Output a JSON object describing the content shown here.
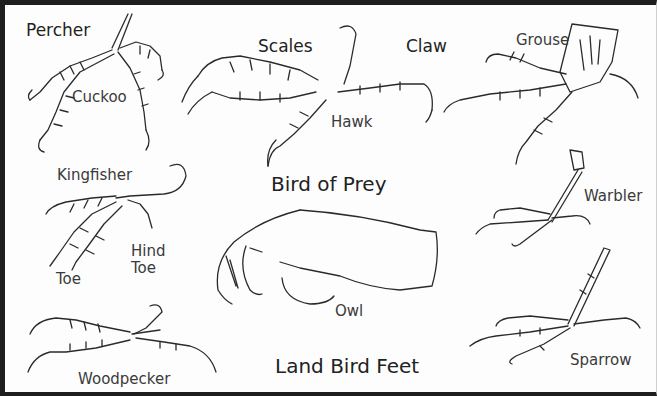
{
  "title": "Land Bird Feet",
  "subtitle": "Bird of Prey",
  "labels": {
    "percher": "Percher",
    "cuckoo": "Cuckoo",
    "scales": "Scales",
    "claw": "Claw",
    "grouse": "Grouse",
    "hawk": "Hawk",
    "kingfisher": "Kingfisher",
    "warbler": "Warbler",
    "hind_toe": "Hind\nToe",
    "toe": "Toe",
    "owl": "Owl",
    "woodpecker": "Woodpecker",
    "sparrow": "Sparrow"
  },
  "colors": {
    "frame": "#1e1e1e",
    "ink": "#333333",
    "paper": "#fdfdfd"
  }
}
